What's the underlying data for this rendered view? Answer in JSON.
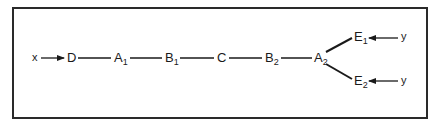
{
  "diagram": {
    "type": "chain-with-branch",
    "inputs": [
      {
        "id": "x",
        "label": "x",
        "target": "D"
      },
      {
        "id": "y1",
        "label": "y",
        "target": "E1"
      },
      {
        "id": "y2",
        "label": "y",
        "target": "E2"
      }
    ],
    "nodes": [
      {
        "id": "D",
        "base": "D",
        "sub": ""
      },
      {
        "id": "A1",
        "base": "A",
        "sub": "1"
      },
      {
        "id": "B1",
        "base": "B",
        "sub": "1"
      },
      {
        "id": "C",
        "base": "C",
        "sub": ""
      },
      {
        "id": "B2",
        "base": "B",
        "sub": "2"
      },
      {
        "id": "A2",
        "base": "A",
        "sub": "2"
      },
      {
        "id": "E1",
        "base": "E",
        "sub": "1"
      },
      {
        "id": "E2",
        "base": "E",
        "sub": "2"
      }
    ],
    "edges": [
      {
        "from": "x",
        "to": "D",
        "arrow": true
      },
      {
        "from": "D",
        "to": "A1"
      },
      {
        "from": "A1",
        "to": "B1"
      },
      {
        "from": "B1",
        "to": "C"
      },
      {
        "from": "C",
        "to": "B2"
      },
      {
        "from": "B2",
        "to": "A2"
      },
      {
        "from": "A2",
        "to": "E1"
      },
      {
        "from": "A2",
        "to": "E2"
      },
      {
        "from": "y1",
        "to": "E1",
        "arrow": true
      },
      {
        "from": "y2",
        "to": "E2",
        "arrow": true
      }
    ],
    "colors": {
      "line": "#1a1a1a",
      "frame": "#2a2a2a",
      "background": "#ffffff"
    }
  }
}
